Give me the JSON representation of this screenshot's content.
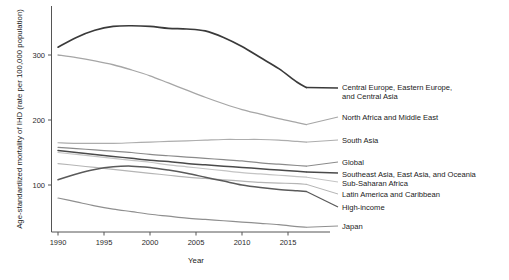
{
  "chart_data": {
    "type": "line",
    "title": "",
    "xlabel": "Year",
    "ylabel": "Age-standardized mortality of IHD (rate per 100,000 population)",
    "xlim": [
      1990,
      2017
    ],
    "ylim": [
      20,
      360
    ],
    "grid": false,
    "legend_position": "right-of-plot-inline-labels",
    "xticks": [
      1990,
      1995,
      2000,
      2005,
      2010,
      2015
    ],
    "xtick_labels": [
      "1990",
      "1995",
      "2000",
      "2005",
      "2010",
      "2015"
    ],
    "yticks": [
      100,
      200,
      300
    ],
    "ytick_labels": [
      "100",
      "200",
      "300"
    ],
    "x": [
      1990,
      1992,
      1994,
      1996,
      1998,
      2000,
      2002,
      2004,
      2006,
      2008,
      2010,
      2012,
      2014,
      2016,
      2017
    ],
    "series": [
      {
        "name": "Central Europe, Eastern Europe, and Central Asia",
        "color": "#3a3a3a",
        "width": 1.7,
        "label_x": 2017,
        "values": [
          312,
          327,
          338,
          344,
          345,
          344,
          341,
          340,
          337,
          327,
          313,
          296,
          279,
          258,
          250
        ]
      },
      {
        "name": "North Africa and Middle East",
        "color": "#a6a6a6",
        "width": 1.3,
        "label_x": 2017,
        "values": [
          300,
          296,
          291,
          285,
          277,
          268,
          257,
          246,
          235,
          225,
          216,
          209,
          202,
          196,
          193
        ]
      },
      {
        "name": "South Asia",
        "color": "#adadad",
        "width": 1.2,
        "label_x": 2017,
        "values": [
          165,
          164,
          164,
          164,
          165,
          166,
          167,
          168,
          169,
          170,
          170,
          170,
          169,
          167,
          166
        ]
      },
      {
        "name": "Global",
        "color": "#8a8a8a",
        "width": 1.2,
        "label_x": 2017,
        "values": [
          158,
          156,
          154,
          152,
          150,
          147,
          145,
          143,
          141,
          139,
          137,
          134,
          132,
          130,
          129
        ]
      },
      {
        "name": "Southeast Asia, East Asia, and Oceania",
        "color": "#4a4a4a",
        "width": 1.5,
        "label_x": 2017,
        "values": [
          153,
          150,
          147,
          144,
          141,
          138,
          136,
          133,
          131,
          129,
          127,
          125,
          123,
          121,
          120
        ]
      },
      {
        "name": "Sub-Saharan Africa",
        "color": "#c4c4c4",
        "width": 1.2,
        "label_x": 2017,
        "values": [
          150,
          147,
          144,
          141,
          138,
          135,
          131,
          128,
          125,
          122,
          119,
          117,
          115,
          113,
          112
        ]
      },
      {
        "name": "Latin America and Caribbean",
        "color": "#b5b5b5",
        "width": 1.2,
        "label_x": 2017,
        "values": [
          133,
          130,
          127,
          124,
          121,
          118,
          115,
          112,
          110,
          108,
          106,
          104,
          103,
          102,
          101
        ]
      },
      {
        "name": "High-income",
        "color": "#5a5a5a",
        "width": 1.5,
        "label_x": 2017,
        "values": [
          108,
          117,
          124,
          128,
          129,
          127,
          123,
          118,
          112,
          106,
          100,
          96,
          93,
          91,
          90
        ]
      },
      {
        "name": "Japan",
        "color": "#8f8f8f",
        "width": 1.2,
        "label_x": 2017,
        "values": [
          80,
          74,
          68,
          63,
          59,
          55,
          52,
          49,
          47,
          45,
          43,
          41,
          39,
          36,
          35
        ]
      }
    ]
  },
  "axes": {
    "y_title": "Age-standardized mortality of IHD (rate per 100,000 population)",
    "x_title": "Year",
    "x_tick_labels": [
      "1990",
      "1995",
      "2000",
      "2005",
      "2010",
      "2015"
    ],
    "y_tick_labels": [
      "300",
      "200",
      "100"
    ]
  },
  "labels": [
    {
      "id": "central-europe",
      "line1": "Central Europe, Eastern Europe,",
      "line2": "and Central Asia"
    },
    {
      "id": "north-africa",
      "line1": "North Africa and Middle East",
      "line2": ""
    },
    {
      "id": "south-asia",
      "line1": "South Asia",
      "line2": ""
    },
    {
      "id": "global",
      "line1": "Global",
      "line2": ""
    },
    {
      "id": "southeast-asia",
      "line1": "Southeast Asia, East Asia, and Oceania",
      "line2": ""
    },
    {
      "id": "sub-saharan-africa",
      "line1": "Sub-Saharan Africa",
      "line2": ""
    },
    {
      "id": "latin-america",
      "line1": "Latin America and Caribbean",
      "line2": ""
    },
    {
      "id": "high-income",
      "line1": "High-income",
      "line2": ""
    },
    {
      "id": "japan",
      "line1": "Japan",
      "line2": ""
    }
  ],
  "colors": {
    "axis": "#555555",
    "text": "#1a1a1a",
    "background": "#ffffff"
  }
}
